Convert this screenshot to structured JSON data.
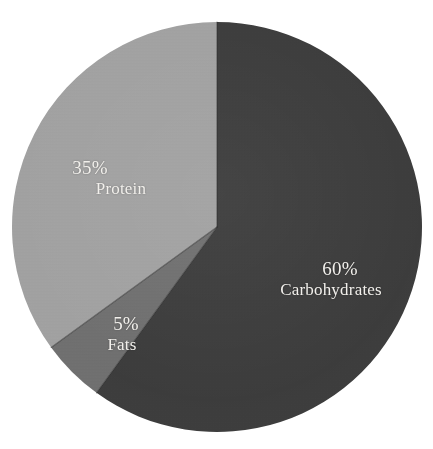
{
  "chart_data": {
    "type": "pie",
    "title": "",
    "subtitle": "",
    "xlabel": "",
    "ylabel": "",
    "legend": "none",
    "grid": false,
    "label_format": "percent-above-name",
    "start_angle_deg": 0,
    "direction": "clockwise",
    "categories": [
      "Carbohydrates",
      "Fats",
      "Protein"
    ],
    "values": [
      60,
      5,
      35
    ],
    "slices": [
      {
        "name": "Carbohydrates",
        "value": 60,
        "percent_label": "60%",
        "color": "#3a3a3a",
        "label_color": "#f2f0ec"
      },
      {
        "name": "Fats",
        "value": 5,
        "percent_label": "5%",
        "color": "#6e6e6e",
        "label_color": "#f2f0ec"
      },
      {
        "name": "Protein",
        "value": 35,
        "percent_label": "35%",
        "color": "#a0a0a0",
        "label_color": "#f2f0ec"
      }
    ]
  },
  "figure": {
    "background_color": "#ffffff",
    "width": 433,
    "height": 449,
    "center_x": 217,
    "center_y": 227,
    "radius": 205,
    "separator_color": "#2a2a2a"
  }
}
